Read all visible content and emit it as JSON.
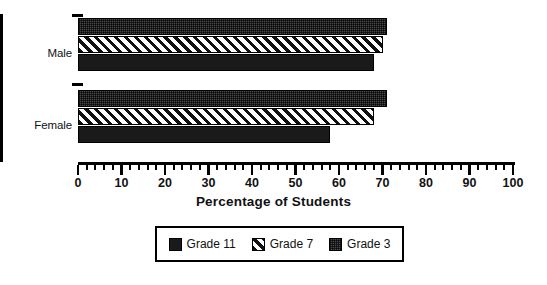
{
  "chart_data": {
    "type": "bar",
    "orientation": "horizontal",
    "title": "",
    "xlabel": "Percentage of Students",
    "ylabel": "",
    "categories": [
      "Male",
      "Female"
    ],
    "series": [
      {
        "name": "Grade 11",
        "pattern": "solid-black",
        "values": [
          68,
          58
        ]
      },
      {
        "name": "Grade 7",
        "pattern": "diagonal-hatch",
        "values": [
          70,
          68
        ]
      },
      {
        "name": "Grade 3",
        "pattern": "dark-stipple",
        "values": [
          71,
          71
        ]
      }
    ],
    "xlim": [
      0,
      100
    ],
    "xticks": [
      0,
      10,
      20,
      30,
      40,
      50,
      60,
      70,
      80,
      90,
      100
    ],
    "xtick_labels": [
      "0",
      "10",
      "20",
      "30",
      "40",
      "50",
      "60",
      "70",
      "80",
      "90",
      "100"
    ],
    "minor_tick_step": 2,
    "grid": false,
    "legend_position": "below-center",
    "bar_order_top_to_bottom": [
      "Grade 3",
      "Grade 7",
      "Grade 11"
    ],
    "colors": {
      "grade_11": "#1a1a1a",
      "grade_7_hatch": "#111111",
      "grade_7_background": "#ffffff",
      "grade_3": "#4a4a4a",
      "axis": "#000000",
      "text": "#111111",
      "background": "#ffffff"
    }
  },
  "axis": {
    "x_title": "Percentage of Students",
    "tick_labels": [
      "0",
      "10",
      "20",
      "30",
      "40",
      "50",
      "60",
      "70",
      "80",
      "90",
      "100"
    ]
  },
  "categories": {
    "male": "Male",
    "female": "Female"
  },
  "legend": {
    "items": [
      {
        "label": "Grade 11"
      },
      {
        "label": "Grade 7"
      },
      {
        "label": "Grade 3"
      }
    ]
  }
}
